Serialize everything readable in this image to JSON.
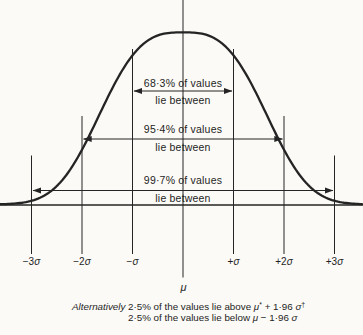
{
  "figure": {
    "bands": [
      {
        "percent": "68·3% of values",
        "range": "lie between"
      },
      {
        "percent": "95·4% of values",
        "range": "lie between"
      },
      {
        "percent": "99·7% of values",
        "range": "lie between"
      }
    ],
    "axis": {
      "ticks": [
        {
          "pre": "−3",
          "sym": "σ"
        },
        {
          "pre": "−2",
          "sym": "σ"
        },
        {
          "pre": "−",
          "sym": "σ"
        },
        {
          "pre": "+",
          "sym": "σ"
        },
        {
          "pre": "+2",
          "sym": "σ"
        },
        {
          "pre": "+3",
          "sym": "σ"
        }
      ],
      "mean": "μ"
    },
    "footnote": {
      "lead": "Alternatively",
      "line1": {
        "a": "2·5% of the values lie above ",
        "mu": "μ",
        "mu_sup": "*",
        "b": " + 1·96 ",
        "sigma": "σ",
        "sigma_sup": "†"
      },
      "line2": {
        "a": "2·5% of the values lie below ",
        "mu": "μ",
        "b": " − 1·96 ",
        "sigma": "σ"
      }
    },
    "colors": {
      "ink": "#242424",
      "paper": "#fbfaf6"
    }
  },
  "chart_data": {
    "type": "area",
    "x_ticks": [
      "−3σ",
      "−2σ",
      "−σ",
      "μ",
      "+σ",
      "+2σ",
      "+3σ"
    ],
    "bands": [
      {
        "interval": "μ ± σ",
        "percent_of_values": 68.3
      },
      {
        "interval": "μ ± 2σ",
        "percent_of_values": 95.4
      },
      {
        "interval": "μ ± 3σ",
        "percent_of_values": 99.7
      }
    ],
    "tails": [
      {
        "condition": "above μ* + 1·96 σ†",
        "percent_of_values": 2.5
      },
      {
        "condition": "below μ − 1·96 σ",
        "percent_of_values": 2.5
      }
    ]
  }
}
